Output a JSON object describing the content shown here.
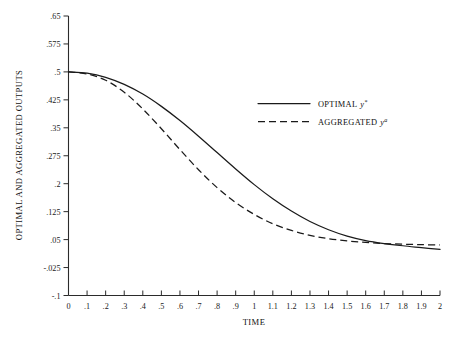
{
  "chart_data": {
    "type": "line",
    "title": "",
    "xlabel": "TIME",
    "ylabel": "OPTIMAL AND AGGREGATED OUTPUTS",
    "xlim": [
      0,
      2
    ],
    "ylim": [
      -0.1,
      0.65
    ],
    "grid": false,
    "legend_position": "upper-right-inside",
    "x_ticks": [
      "0",
      ".1",
      ".2",
      ".3",
      ".4",
      ".5",
      ".6",
      ".7",
      ".8",
      ".9",
      "1",
      "1.1",
      "1.2",
      "1.3",
      "1.4",
      "1.5",
      "1.6",
      "1.7",
      "1.8",
      "1.9",
      "2"
    ],
    "x_tick_values": [
      0,
      0.1,
      0.2,
      0.3,
      0.4,
      0.5,
      0.6,
      0.7,
      0.8,
      0.9,
      1.0,
      1.1,
      1.2,
      1.3,
      1.4,
      1.5,
      1.6,
      1.7,
      1.8,
      1.9,
      2.0
    ],
    "y_ticks": [
      ".65",
      ".575",
      ".5",
      ".425",
      ".35",
      ".275",
      ".2",
      ".125",
      ".05",
      "-.025",
      "-.1"
    ],
    "y_tick_values": [
      0.65,
      0.575,
      0.5,
      0.425,
      0.35,
      0.275,
      0.2,
      0.125,
      0.05,
      -0.025,
      -0.1
    ],
    "x": [
      0,
      0.1,
      0.2,
      0.3,
      0.4,
      0.5,
      0.6,
      0.7,
      0.8,
      0.9,
      1.0,
      1.1,
      1.2,
      1.3,
      1.4,
      1.5,
      1.6,
      1.7,
      1.8,
      1.9,
      2.0
    ],
    "series": [
      {
        "name": "OPTIMAL",
        "symbol": "y",
        "superscript": "*",
        "style": "solid",
        "values": [
          0.5,
          0.4965,
          0.4855,
          0.4665,
          0.4405,
          0.4075,
          0.3695,
          0.3275,
          0.2835,
          0.2395,
          0.1975,
          0.1595,
          0.1265,
          0.0985,
          0.0765,
          0.0595,
          0.0475,
          0.0395,
          0.0335,
          0.0285,
          0.0235
        ]
      },
      {
        "name": "AGGREGATED",
        "symbol": "y",
        "superscript": "a",
        "style": "dashed",
        "values": [
          0.5,
          0.4945,
          0.4775,
          0.4455,
          0.4005,
          0.3475,
          0.2915,
          0.2375,
          0.1895,
          0.1495,
          0.1175,
          0.0925,
          0.0745,
          0.0615,
          0.0525,
          0.0465,
          0.0425,
          0.0395,
          0.0375,
          0.0365,
          0.0355
        ]
      }
    ]
  },
  "legend": {
    "items": [
      {
        "label": "OPTIMAL",
        "symbol": "y",
        "superscript": "*",
        "style": "solid"
      },
      {
        "label": "AGGREGATED",
        "symbol": "y",
        "superscript": "a",
        "style": "dashed"
      }
    ]
  }
}
